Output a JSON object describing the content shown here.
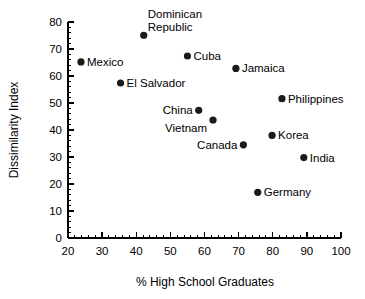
{
  "chart_data": {
    "type": "scatter",
    "title": "",
    "xlabel": "% High School Graduates",
    "ylabel": "Dissimilarity Index",
    "xlim": [
      20,
      100
    ],
    "ylim": [
      0,
      80
    ],
    "xticks": [
      20,
      30,
      40,
      50,
      60,
      70,
      80,
      90,
      100
    ],
    "yticks": [
      0,
      10,
      20,
      30,
      40,
      50,
      60,
      70,
      80
    ],
    "xtick_labels": [
      "20",
      "30",
      "40",
      "50",
      "60",
      "70",
      "80",
      "90",
      "100"
    ],
    "ytick_labels": [
      "0",
      "10",
      "20",
      "30",
      "40",
      "50",
      "60",
      "70",
      "80"
    ],
    "grid": false,
    "legend": false,
    "minor_ticks": true,
    "points": [
      {
        "label": "Mexico",
        "x": 23.8,
        "y": 65.2,
        "label_pos": "right"
      },
      {
        "label": "Dominican Republic",
        "x": 42.2,
        "y": 75.1,
        "label_pos": "above"
      },
      {
        "label": "El Salvador",
        "x": 35.4,
        "y": 57.4,
        "label_pos": "right"
      },
      {
        "label": "Cuba",
        "x": 55.0,
        "y": 67.4,
        "label_pos": "right"
      },
      {
        "label": "Jamaica",
        "x": 69.2,
        "y": 62.8,
        "label_pos": "right"
      },
      {
        "label": "Philippines",
        "x": 82.7,
        "y": 51.6,
        "label_pos": "right"
      },
      {
        "label": "China",
        "x": 58.3,
        "y": 47.3,
        "label_pos": "left"
      },
      {
        "label": "Vietnam",
        "x": 62.5,
        "y": 43.7,
        "label_pos": "belowleft"
      },
      {
        "label": "Korea",
        "x": 79.8,
        "y": 38.0,
        "label_pos": "right"
      },
      {
        "label": "Canada",
        "x": 71.4,
        "y": 34.5,
        "label_pos": "left"
      },
      {
        "label": "India",
        "x": 89.1,
        "y": 29.8,
        "label_pos": "right"
      },
      {
        "label": "Germany",
        "x": 75.6,
        "y": 16.9,
        "label_pos": "right"
      }
    ]
  }
}
